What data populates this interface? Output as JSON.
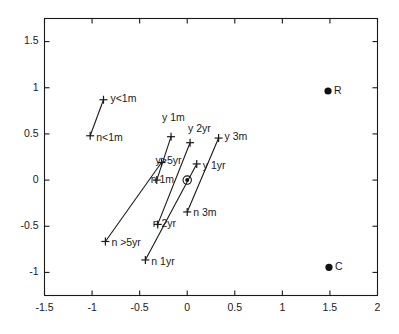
{
  "chart_data": {
    "type": "scatter",
    "title": "",
    "subtitle": "",
    "xlabel": "",
    "ylabel": "",
    "xlim": [
      -1.5,
      2
    ],
    "ylim": [
      -1.25,
      1.75
    ],
    "grid": false,
    "legend": null,
    "xticks": [
      "-1.5",
      "-1",
      "-0.5",
      "0",
      "0.5",
      "1",
      "1.5",
      "2"
    ],
    "xtick_values": [
      -1.5,
      -1,
      -0.5,
      0,
      0.5,
      1,
      1.5,
      2
    ],
    "yticks": [
      "1.5",
      "1",
      "0.5",
      "0",
      "-0.5",
      "-1"
    ],
    "ytick_values": [
      1.5,
      1,
      0.5,
      0,
      -0.5,
      -1
    ],
    "marker_styles": {
      "cross": "plus-marker",
      "filled": "filled-circle",
      "origin": "circled-dot"
    },
    "points": [
      {
        "label": "y<1m",
        "x": -0.88,
        "y": 0.87,
        "marker": "cross",
        "label_dx": 7,
        "label_dy": -1,
        "anchor": "start"
      },
      {
        "label": "n<1m",
        "x": -1.02,
        "y": 0.48,
        "marker": "cross",
        "label_dx": 6,
        "label_dy": 2,
        "anchor": "start"
      },
      {
        "label": "y 1m",
        "x": -0.17,
        "y": 0.47,
        "marker": "cross",
        "label_dx": -9,
        "label_dy": -18,
        "anchor": "middle"
      },
      {
        "label": "y>5yr",
        "x": -0.27,
        "y": 0.19,
        "marker": "cross",
        "label_dx": -6,
        "label_dy": -1,
        "anchor": "end"
      },
      {
        "label": "n 1m",
        "x": -0.32,
        "y": 0.0,
        "marker": "cross",
        "label_dx": -6,
        "label_dy": 0,
        "anchor": "end"
      },
      {
        "label": "y 2yr",
        "x": 0.03,
        "y": 0.405,
        "marker": "cross",
        "label_dx": -2,
        "label_dy": -13,
        "anchor": "middle"
      },
      {
        "label": "y 3m",
        "x": 0.33,
        "y": 0.455,
        "marker": "cross",
        "label_dx": 6,
        "label_dy": -1,
        "anchor": "start"
      },
      {
        "label": "y 1yr",
        "x": 0.1,
        "y": 0.175,
        "marker": "cross",
        "label_dx": 6,
        "label_dy": 2,
        "anchor": "start"
      },
      {
        "label": "n 3m",
        "x": 0.0,
        "y": -0.345,
        "marker": "cross",
        "label_dx": 6,
        "label_dy": 1,
        "anchor": "start"
      },
      {
        "label": "n 2yr",
        "x": -0.31,
        "y": -0.48,
        "marker": "cross",
        "label_dx": -5,
        "label_dy": 0,
        "anchor": "end"
      },
      {
        "label": "n >5yr",
        "x": -0.86,
        "y": -0.665,
        "marker": "cross",
        "label_dx": 6,
        "label_dy": 2,
        "anchor": "start"
      },
      {
        "label": "n 1yr",
        "x": -0.44,
        "y": -0.865,
        "marker": "cross",
        "label_dx": 6,
        "label_dy": 2,
        "anchor": "start"
      },
      {
        "label": "R",
        "x": 1.48,
        "y": 0.965,
        "marker": "filled",
        "label_dx": 6,
        "label_dy": 0,
        "anchor": "start"
      },
      {
        "label": "C",
        "x": 1.49,
        "y": -0.945,
        "marker": "filled",
        "label_dx": 6,
        "label_dy": 0,
        "anchor": "start"
      },
      {
        "label": "",
        "x": 0.0,
        "y": 0.0,
        "marker": "origin",
        "label_dx": 0,
        "label_dy": 0,
        "anchor": "start"
      }
    ],
    "connectors": [
      {
        "name": "lt1m",
        "from": "y<1m",
        "to": "n<1m"
      },
      {
        "name": "1m",
        "from": "y 1m",
        "to": "n 1m"
      },
      {
        "name": "gt5yr",
        "from": "y>5yr",
        "to": "n >5yr"
      },
      {
        "name": "2yr",
        "from": "y 2yr",
        "to": "n 2yr"
      },
      {
        "name": "3m",
        "from": "y 3m",
        "to": "n 3m"
      },
      {
        "name": "1yr",
        "from": "y 1yr",
        "to": "n 1yr"
      }
    ]
  }
}
